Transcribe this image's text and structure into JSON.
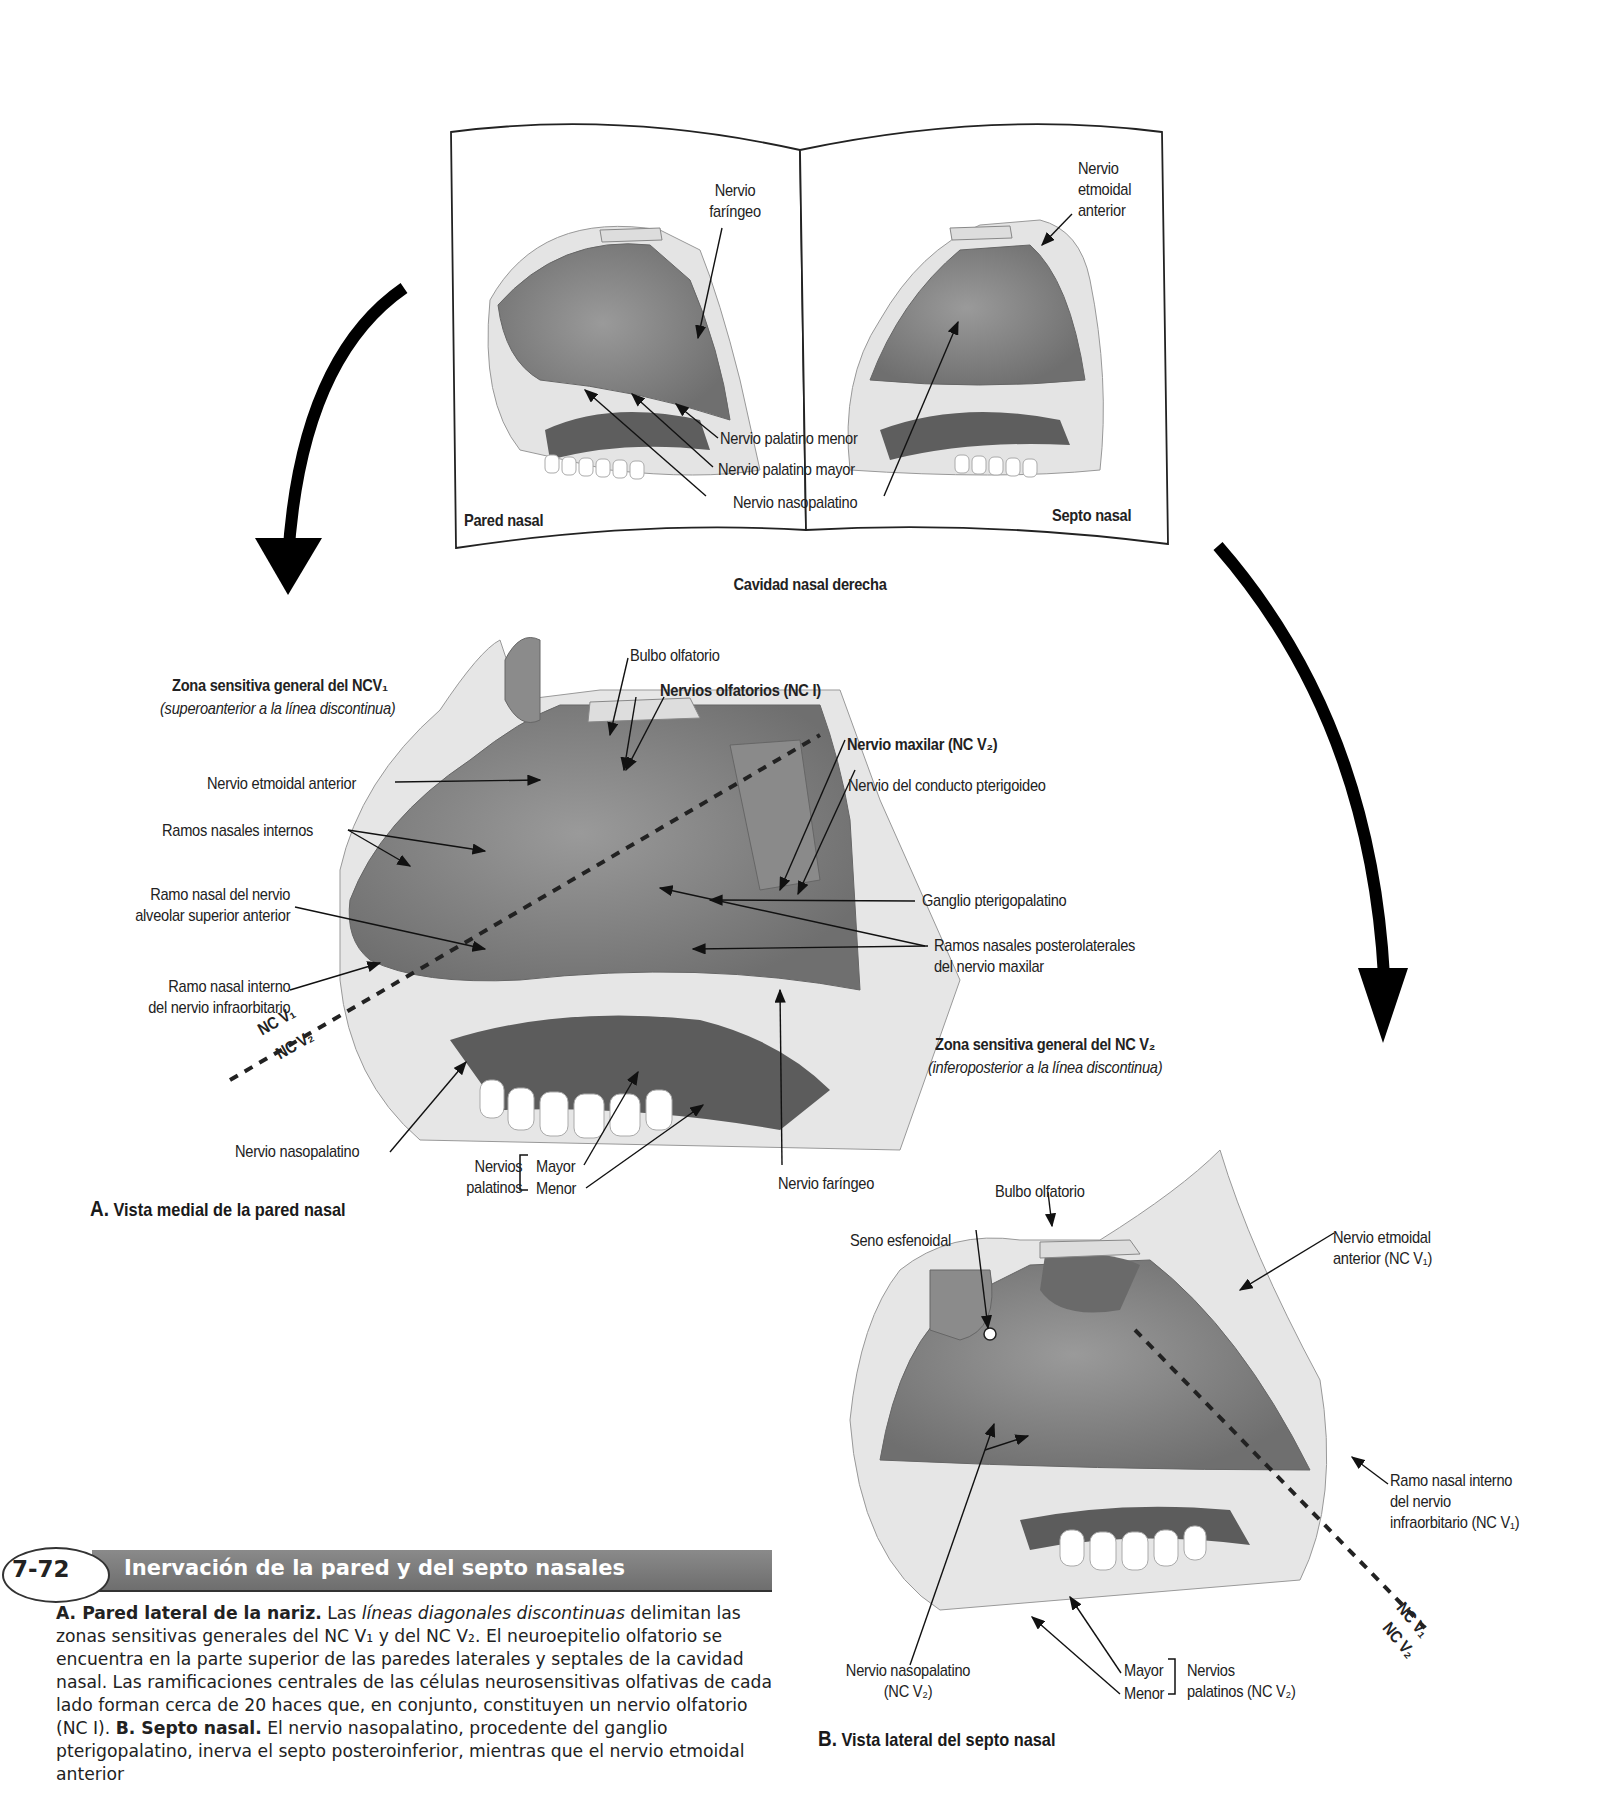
{
  "figure": {
    "number": "7-72",
    "title": "Inervación de la pared y del septo nasales",
    "caption": {
      "a_heading": "A. Pared lateral de la nariz.",
      "a_text_1": " Las ",
      "a_italic": "líneas diagonales discontinuas",
      "a_text_2": " delimitan las zonas sensitivas generales del NC V₁ y del NC V₂. El neuroepitelio olfatorio se encuentra en la parte superior de las paredes laterales y septales de la cavidad nasal. Las ramificaciones centrales de las células neurosensitivas olfativas de cada lado forman cerca de 20 haces que, en conjunto, constituyen un nervio olfatorio (NC I). ",
      "b_heading": "B. Septo nasal.",
      "b_text": " El nervio nasopalatino, procedente del ganglio pterigopalatino, inerva el septo posteroinferior, mientras que el nervio etmoidal anterior"
    }
  },
  "overview": {
    "title": "Cavidad nasal derecha",
    "left_page_label": "Pared nasal",
    "right_page_label": "Septo nasal",
    "labels": {
      "nervio_faringeo": [
        "Nervio",
        "faríngeo"
      ],
      "nervio_etmoidal_anterior": [
        "Nervio",
        "etmoidal",
        "anterior"
      ],
      "palatino_menor": "Nervio palatino menor",
      "palatino_mayor": "Nervio palatino mayor",
      "nasopalatino": "Nervio nasopalatino"
    }
  },
  "panel_a": {
    "letter": "A.",
    "title": "Vista medial de la pared nasal",
    "zone_v1_title": "Zona sensitiva general del NCV₁",
    "zone_v1_sub": "(superoanterior a la línea discontinua)",
    "zone_v2_title": "Zona sensitiva general del NC V₂",
    "zone_v2_sub": "(inferoposterior a la línea discontinua)",
    "labels": {
      "bulbo_olfatorio": "Bulbo olfatorio",
      "nervios_olfatorios": "Nervios olfatorios (NC I)",
      "nervio_maxilar": "Nervio maxilar (NC V₂)",
      "conducto_pterigoideo": "Nervio del conducto pterigoideo",
      "etmoidal_anterior": "Nervio etmoidal anterior",
      "ramos_nasales_internos": "Ramos nasales internos",
      "ramo_alveolar": [
        "Ramo nasal del nervio",
        "alveolar superior anterior"
      ],
      "ramo_infraorbitario": [
        "Ramo nasal interno",
        "del nervio infraorbitario"
      ],
      "ganglio": "Ganglio pterigopalatino",
      "ramos_posterolaterales": [
        "Ramos nasales posterolaterales",
        "del nervio maxilar"
      ],
      "nasopalatino": "Nervio nasopalatino",
      "nervios_palatinos": [
        "Nervios",
        "palatinos"
      ],
      "mayor": "Mayor",
      "menor": "Menor",
      "faringeo": "Nervio faríngeo",
      "nc_v1": "NC V₁",
      "nc_v2": "NC V₂"
    }
  },
  "panel_b": {
    "letter": "B.",
    "title": "Vista lateral del septo nasal",
    "labels": {
      "bulbo_olfatorio": "Bulbo olfatorio",
      "seno_esfenoidal": "Seno esfenoidal",
      "etmoidal_anterior": [
        "Nervio etmoidal",
        "anterior (NC V₁)"
      ],
      "ramo_infraorbitario": [
        "Ramo nasal interno",
        "del nervio",
        "infraorbitario (NC V₁)"
      ],
      "nasopalatino": [
        "Nervio nasopalatino",
        "(NC V₂)"
      ],
      "mayor": "Mayor",
      "menor": "Menor",
      "nervios_palatinos": [
        "Nervios",
        "palatinos (NC V₂)"
      ],
      "nc_v1": "NC V₁",
      "nc_v2": "NC V₂"
    }
  },
  "colors": {
    "tissue_dark": "#7d7d7d",
    "tissue_mid": "#a8a8a8",
    "bone": "#e2e2e2",
    "caption_bar": "#7a7a7a",
    "text": "#222222"
  }
}
